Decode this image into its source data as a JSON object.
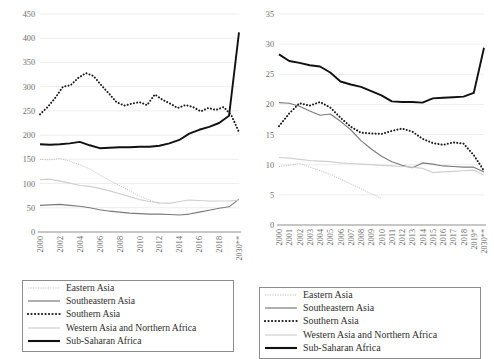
{
  "legend": {
    "entries": [
      {
        "label": "Eastern Asia",
        "key": "eastern_asia",
        "style": "fine-dotted-light",
        "color": "#b9b9b9"
      },
      {
        "label": "Southeastern Asia",
        "key": "southeastern_asia",
        "style": "solid-medium",
        "color": "#7a7a7a"
      },
      {
        "label": "Southern Asia",
        "key": "southern_asia",
        "style": "heavy-dotted-black",
        "color": "#1a1a1a"
      },
      {
        "label": "Western Asia and Northern Africa",
        "key": "western_asia_northern_africa",
        "style": "solid-light",
        "color": "#cfcfcf"
      },
      {
        "label": "Sub-Saharan Africa",
        "key": "sub_saharan_africa",
        "style": "solid-thick-black",
        "color": "#111111"
      }
    ]
  },
  "chart_data": [
    {
      "type": "line",
      "title": "",
      "panel": "left",
      "xlabel": "",
      "ylabel": "",
      "ylim": [
        0,
        450
      ],
      "yticks": [
        0,
        50,
        100,
        150,
        200,
        250,
        300,
        350,
        400,
        450
      ],
      "grid": true,
      "legend_position": "bottom",
      "x": [
        "2000",
        "2001",
        "2002",
        "2003",
        "2004",
        "2005",
        "2006",
        "2007",
        "2008",
        "2009",
        "2010",
        "2011",
        "2012",
        "2013",
        "2014",
        "2015",
        "2016",
        "2017",
        "2018",
        "2019*",
        "2030**"
      ],
      "xtick_labels": [
        "2000",
        "2002",
        "2004",
        "2006",
        "2008",
        "2010",
        "2012",
        "2014",
        "2016",
        "2018",
        "2030**"
      ],
      "series": [
        {
          "name": "Eastern Asia",
          "key": "eastern_asia",
          "values": [
            150,
            149,
            152,
            146,
            139,
            130,
            118,
            106,
            96,
            85,
            74,
            66,
            58,
            null,
            null,
            null,
            null,
            null,
            null,
            null,
            null
          ]
        },
        {
          "name": "Southeastern Asia",
          "key": "southeastern_asia",
          "values": [
            55,
            56,
            57,
            55,
            53,
            50,
            46,
            43,
            41,
            39,
            38,
            37,
            37,
            36,
            35,
            37,
            41,
            45,
            49,
            52,
            68
          ]
        },
        {
          "name": "Southern Asia",
          "key": "southern_asia",
          "values": [
            243,
            258,
            277,
            300,
            303,
            318,
            328,
            322,
            303,
            286,
            268,
            261,
            265,
            268,
            262,
            284,
            273,
            265,
            256,
            262,
            258,
            249,
            256,
            252,
            258,
            241,
            206
          ]
        },
        {
          "name": "Western Asia and Northern Africa",
          "key": "western_asia_northern_africa",
          "values": [
            108,
            109,
            105,
            101,
            96,
            94,
            90,
            85,
            79,
            73,
            67,
            63,
            60,
            59,
            63,
            66,
            65,
            64,
            64,
            64,
            66
          ]
        },
        {
          "name": "Sub-Saharan Africa",
          "key": "sub_saharan_africa",
          "values": [
            181,
            180,
            181,
            183,
            186,
            179,
            173,
            174,
            175,
            175,
            176,
            176,
            178,
            183,
            190,
            203,
            211,
            217,
            225,
            240,
            412
          ]
        }
      ]
    },
    {
      "type": "line",
      "title": "",
      "panel": "right",
      "xlabel": "",
      "ylabel": "",
      "ylim": [
        0,
        35
      ],
      "yticks": [
        0,
        5,
        10,
        15,
        20,
        25,
        30,
        35
      ],
      "grid": true,
      "legend_position": "bottom",
      "x": [
        "2000",
        "2001",
        "2002",
        "2003",
        "2004",
        "2005",
        "2006",
        "2007",
        "2008",
        "2009",
        "2010",
        "2011",
        "2012",
        "2013",
        "2014",
        "2015",
        "2016",
        "2017",
        "2018",
        "2019*",
        "2030**"
      ],
      "xtick_labels": [
        "2000",
        "2001",
        "2002",
        "2003",
        "2004",
        "2005",
        "2006",
        "2007",
        "2008",
        "2009",
        "2010",
        "2011",
        "2012",
        "2013",
        "2014",
        "2015",
        "2016",
        "2017",
        "2018",
        "2019*",
        "2030**"
      ],
      "series": [
        {
          "name": "Eastern Asia",
          "key": "eastern_asia",
          "values": [
            9.7,
            9.9,
            10.2,
            9.6,
            9.0,
            8.4,
            7.6,
            6.8,
            6.0,
            5.2,
            4.4,
            null,
            null,
            null,
            null,
            null,
            null,
            null,
            null,
            null,
            null
          ]
        },
        {
          "name": "Southeastern Asia",
          "key": "southeastern_asia",
          "values": [
            20.3,
            20.2,
            19.7,
            18.9,
            18.2,
            18.4,
            17.2,
            15.8,
            14.0,
            12.6,
            11.4,
            10.5,
            9.9,
            9.5,
            10.3,
            10.1,
            9.8,
            9.7,
            9.6,
            9.6,
            8.8
          ]
        },
        {
          "name": "Southern Asia",
          "key": "southern_asia",
          "values": [
            16.4,
            18.5,
            20.2,
            19.8,
            20.4,
            19.5,
            17.8,
            16.3,
            15.3,
            15.2,
            15.1,
            15.6,
            16.0,
            15.5,
            14.3,
            13.6,
            13.3,
            13.7,
            13.5,
            11.6,
            9.0
          ]
        },
        {
          "name": "Western Asia and Northern Africa",
          "key": "western_asia_northern_africa",
          "values": [
            11.2,
            11.1,
            10.9,
            10.7,
            10.6,
            10.5,
            10.3,
            10.2,
            10.1,
            10.0,
            9.9,
            9.8,
            9.7,
            9.6,
            9.4,
            8.7,
            8.8,
            8.9,
            9.0,
            9.1,
            8.3
          ]
        },
        {
          "name": "Sub-Saharan Africa",
          "key": "sub_saharan_africa",
          "values": [
            28.3,
            27.2,
            26.9,
            26.5,
            26.3,
            25.3,
            23.8,
            23.3,
            22.9,
            22.2,
            21.5,
            20.5,
            20.4,
            20.4,
            20.3,
            21.0,
            21.1,
            21.2,
            21.3,
            21.9,
            29.4
          ]
        }
      ]
    }
  ]
}
